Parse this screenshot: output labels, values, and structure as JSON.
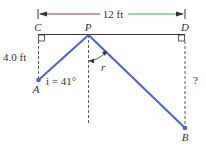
{
  "diagram": {
    "dimension_label": "12 ft",
    "height_label": "4.0 ft",
    "angle_label": "i = 41°",
    "refraction_label": "r",
    "unknown_label": "?",
    "points": {
      "C": "C",
      "P": "P",
      "D": "D",
      "A": "A",
      "B": "B"
    },
    "colors": {
      "ray": "#4a64c8",
      "arrow_left": "#7a3a5a",
      "arrow_right": "#3cb043",
      "line": "#333333"
    }
  }
}
